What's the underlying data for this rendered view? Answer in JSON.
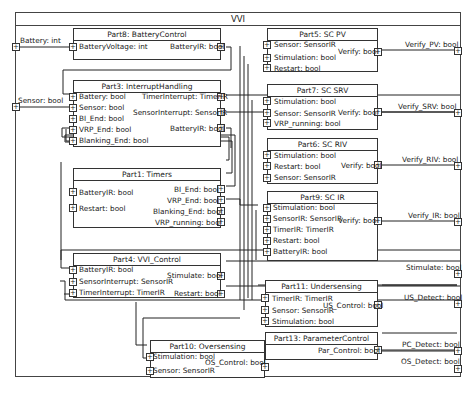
{
  "diagram": {
    "title": "VVI",
    "external_inputs": [
      {
        "label": "Battery: int"
      },
      {
        "label": "Sensor: bool"
      }
    ],
    "external_outputs": [
      {
        "label": "Verify_PV: bool"
      },
      {
        "label": "Verify_SRV: bool"
      },
      {
        "label": "Verify_RIV: bool"
      },
      {
        "label": "Verify_IR: bool"
      },
      {
        "label": "Stimulate: bool"
      },
      {
        "label": "US_Detect: bool"
      },
      {
        "label": "PC_Detect: bool"
      },
      {
        "label": "OS_Detect: bool"
      }
    ],
    "parts": {
      "part8": {
        "title": "Part8: BatteryControl",
        "inputs": [
          "BatteryVoltage: int"
        ],
        "outputs": [
          "BatteryIR: bool"
        ]
      },
      "part3": {
        "title": "Part3: InterruptHandling",
        "inputs": [
          "Battery: bool",
          "Sensor: bool",
          "BI_End: bool",
          "VRP_End: bool",
          "Blanking_End: bool"
        ],
        "outputs": [
          "TimerInterrupt: TimerIR",
          "SensorInterrupt: SensorIR",
          "BatteryIR: bool"
        ]
      },
      "part1": {
        "title": "Part1: Timers",
        "inputs": [
          "BatteryIR: bool",
          "Restart: bool"
        ],
        "outputs": [
          "BI_End: bool",
          "VRP_End: bool",
          "Blanking_End: bool",
          "VRP_running: bool"
        ]
      },
      "part4": {
        "title": "Part4: VVI_Control",
        "inputs": [
          "BatteryIR: bool",
          "SensorInterrupt: SensorIR",
          "TimerInterrupt: TimerIR"
        ],
        "outputs": [
          "Stimulate: bool",
          "Restart: bool"
        ]
      },
      "part10": {
        "title": "Part10: Oversensing",
        "inputs": [
          "Stimulation: bool",
          "Sensor: SensorIR"
        ],
        "outputs": [
          "OS_Control: bool"
        ]
      },
      "part5": {
        "title": "Part5: SC PV",
        "inputs": [
          "Sensor: SensorIR",
          "Stimulation: bool",
          "Restart: bool"
        ],
        "outputs": [
          "Verify: bool"
        ]
      },
      "part7": {
        "title": "Part7: SC SRV",
        "inputs": [
          "Stimulation: bool",
          "Sensor: SensorIR",
          "VRP_running: bool"
        ],
        "outputs": [
          "Verify: bool"
        ]
      },
      "part6": {
        "title": "Part6: SC RIV",
        "inputs": [
          "Stimulation: bool",
          "Restart: bool",
          "Sensor: SensorIR"
        ],
        "outputs": [
          "Verify: bool"
        ]
      },
      "part9": {
        "title": "Part9: SC IR",
        "inputs": [
          "Stimulation: bool",
          "SensorIR: SensorIR",
          "TimerIR: TimerIR",
          "Restart: bool",
          "BatteryIR: bool"
        ],
        "outputs": [
          "Verify: bool"
        ]
      },
      "part11": {
        "title": "Part11: Undersensing",
        "inputs": [
          "TimerIR: TimerIR",
          "Sensor: SensorIR",
          "Stimulation: bool"
        ],
        "outputs": [
          "US_Control: bool"
        ]
      },
      "part13": {
        "title": "Part13: ParameterControl",
        "inputs": [],
        "outputs": [
          "Par_Control: bool"
        ]
      }
    }
  }
}
